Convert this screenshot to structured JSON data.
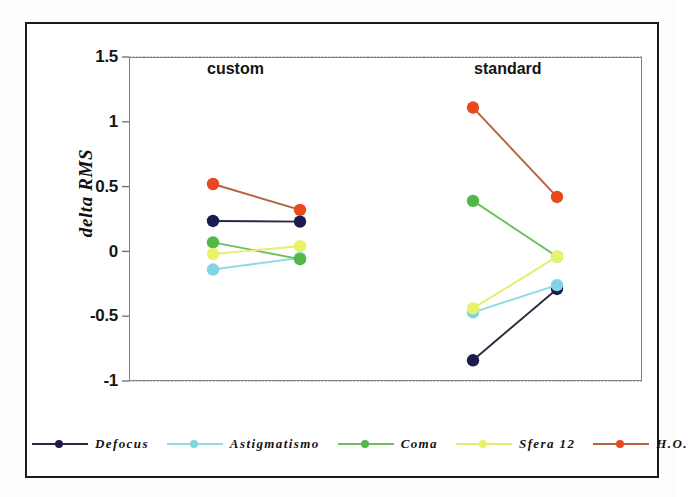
{
  "chart_data": {
    "type": "line",
    "title": "",
    "xlabel": "",
    "ylabel": "delta RMS",
    "ylim": [
      -1,
      1.5
    ],
    "ytick_labels": [
      "1.5",
      "1",
      "0.5",
      "0",
      "-0.5",
      "-1"
    ],
    "ytick_values": [
      1.5,
      1,
      0.5,
      0,
      -0.5,
      -1
    ],
    "grid": false,
    "legend_position": "bottom",
    "group_labels": [
      "custom",
      "standard"
    ],
    "x": [
      "custom-pre",
      "custom-post",
      "standard-pre",
      "standard-post"
    ],
    "series": [
      {
        "name": "Defocus",
        "color": "#1b1b4f",
        "line_color": "#2a2a3f",
        "custom": [
          0.235,
          0.23
        ],
        "standard": [
          -0.84,
          -0.29
        ]
      },
      {
        "name": "Astigmatismo",
        "color": "#7fd4e6",
        "line_color": "#8fd8e8",
        "custom": [
          -0.14,
          -0.05
        ],
        "standard": [
          -0.47,
          -0.26
        ]
      },
      {
        "name": "Coma",
        "color": "#4fb847",
        "line_color": "#6cbf5b",
        "custom": [
          0.07,
          -0.06
        ],
        "standard": [
          0.39,
          -0.04
        ]
      },
      {
        "name": "Sfera 12",
        "color": "#e8f36a",
        "line_color": "#e2ef6f",
        "custom": [
          -0.02,
          0.04
        ],
        "standard": [
          -0.44,
          -0.04
        ]
      },
      {
        "name": "H.O.",
        "color": "#e8491f",
        "line_color": "#b5613f",
        "custom": [
          0.52,
          0.32
        ],
        "standard": [
          1.11,
          0.42
        ]
      }
    ]
  },
  "axis": {
    "y_label": "delta RMS",
    "ticks": [
      {
        "label": "1.5"
      },
      {
        "label": "1"
      },
      {
        "label": "0.5"
      },
      {
        "label": "0"
      },
      {
        "label": "-0.5"
      },
      {
        "label": "-1"
      }
    ]
  },
  "groups": [
    {
      "label": "custom"
    },
    {
      "label": "standard"
    }
  ],
  "legend": {
    "items": [
      {
        "label": "Defocus"
      },
      {
        "label": "Astigmatismo"
      },
      {
        "label": "Coma"
      },
      {
        "label": "Sfera 12"
      },
      {
        "label": "H.O."
      }
    ]
  }
}
